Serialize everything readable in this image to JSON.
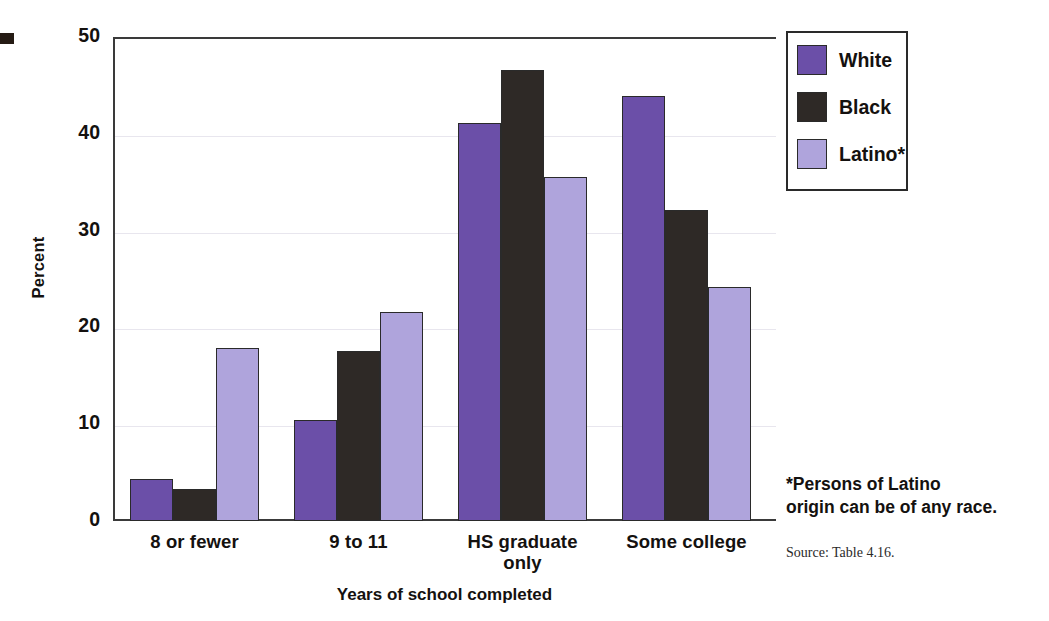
{
  "chart_data": {
    "type": "bar",
    "title": "",
    "xlabel": "Years of school completed",
    "ylabel": "Percent",
    "ylim": [
      0,
      50
    ],
    "yticks": [
      0,
      10,
      20,
      30,
      40,
      50
    ],
    "grid": true,
    "legend_position": "top-right",
    "categories": [
      "8 or fewer",
      "9 to 11",
      "HS graduate only",
      "Some college"
    ],
    "category_lines": [
      [
        "8 or fewer"
      ],
      [
        "9 to 11"
      ],
      [
        "HS graduate",
        "only"
      ],
      [
        "Some college"
      ]
    ],
    "series": [
      {
        "name": "White",
        "color": "#6B4FA8",
        "values": [
          4.3,
          10.4,
          41.1,
          43.9
        ]
      },
      {
        "name": "Black",
        "color": "#2E2926",
        "values": [
          3.3,
          17.6,
          46.6,
          32.1
        ]
      },
      {
        "name": "Latino*",
        "color": "#AFA4DC",
        "values": [
          17.9,
          21.6,
          35.5,
          24.2
        ]
      }
    ],
    "annotations": [
      "*Persons of Latino origin can be of any race."
    ],
    "source": "Source: Table 4.16."
  },
  "axes": {
    "y_tick_labels": [
      "50",
      "40",
      "30",
      "20",
      "10",
      "0"
    ],
    "y_axis_title": "Percent",
    "x_axis_title": "Years of school completed"
  },
  "legend": {
    "items": [
      {
        "label": "White",
        "color": "#6B4FA8"
      },
      {
        "label": "Black",
        "color": "#2E2926"
      },
      {
        "label": "Latino*",
        "color": "#AFA4DC"
      }
    ]
  },
  "footnote": {
    "line1": "*Persons of Latino",
    "line2": "origin can be of any race."
  },
  "source": {
    "text": "Source: Table 4.16."
  },
  "colors": {
    "white_series": "#6B4FA8",
    "black_series": "#2E2926",
    "latino_series": "#AFA4DC",
    "axis": "#3a3a3a",
    "background": "#ffffff"
  }
}
